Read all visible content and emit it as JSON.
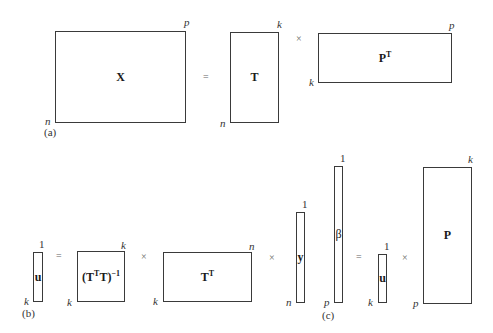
{
  "panels": {
    "a": {
      "label": "(a)",
      "matrices": {
        "X": {
          "name": "X",
          "rows": "n",
          "cols": "p"
        },
        "T": {
          "name": "T",
          "rows": "n",
          "cols": "k"
        },
        "PT": {
          "name": "P",
          "sup": "T",
          "rows": "k",
          "cols": "p"
        }
      },
      "operators": {
        "eq": "=",
        "times": "×"
      }
    },
    "b": {
      "label": "(b)",
      "matrices": {
        "u": {
          "name": "u",
          "rows": "k",
          "cols": "1"
        },
        "TTTinv": {
          "name_open": "(T",
          "sup1": "T",
          "name_mid": "T)",
          "sup2": "−1",
          "rows": "k",
          "cols": "k"
        },
        "TT": {
          "name": "T",
          "sup": "T",
          "rows": "k",
          "cols": "n"
        },
        "y": {
          "name": "y",
          "rows": "n",
          "cols": "1"
        }
      },
      "operators": {
        "eq": "=",
        "times1": "×",
        "times2": "×"
      }
    },
    "c": {
      "label": "(c)",
      "matrices": {
        "beta": {
          "name": "β",
          "rows": "p",
          "cols": "1"
        },
        "u": {
          "name": "u",
          "rows": "k",
          "cols": "1"
        },
        "P": {
          "name": "P",
          "rows": "p",
          "cols": "k"
        }
      },
      "operators": {
        "eq": "=",
        "times": "×"
      }
    }
  }
}
